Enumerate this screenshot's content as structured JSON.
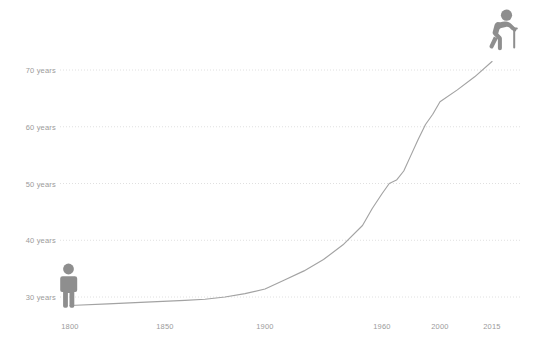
{
  "chart_data": {
    "type": "line",
    "title": "",
    "subtitle": "",
    "xlabel": "",
    "ylabel": "",
    "xlim": [
      1790,
      2020
    ],
    "ylim": [
      26,
      74
    ],
    "grid": true,
    "legend": "none",
    "y_ticks": [
      {
        "value": 30,
        "label": "30 years"
      },
      {
        "value": 40,
        "label": "40 years"
      },
      {
        "value": 50,
        "label": "50 years"
      },
      {
        "value": 60,
        "label": "60 years"
      },
      {
        "value": 70,
        "label": "70 years"
      }
    ],
    "x_ticks": [
      {
        "value": 1800,
        "label": "1800"
      },
      {
        "value": 1850,
        "label": "1850"
      },
      {
        "value": 1900,
        "label": "1900"
      },
      {
        "value": 1960,
        "label": "1960"
      },
      {
        "value": 2000,
        "label": "2000"
      },
      {
        "value": 2015,
        "label": "2015"
      }
    ],
    "series": [
      {
        "name": "Life expectancy",
        "color": "#a3a3a3",
        "x": [
          1800,
          1820,
          1840,
          1860,
          1870,
          1880,
          1890,
          1900,
          1910,
          1920,
          1930,
          1940,
          1950,
          1955,
          1960,
          1965,
          1970,
          1975,
          1980,
          1985,
          1990,
          1995,
          2000,
          2005,
          2010,
          2015
        ],
        "y": [
          28.5,
          28.8,
          29.1,
          29.4,
          29.6,
          30.0,
          30.6,
          31.4,
          33.0,
          34.6,
          36.6,
          39.2,
          42.6,
          45.6,
          48.2,
          50.0,
          50.6,
          52.2,
          55.0,
          57.8,
          60.4,
          62.2,
          64.4,
          66.5,
          68.8,
          71.5
        ]
      }
    ],
    "annotations": [
      {
        "name": "standing-person-icon",
        "x": 1805,
        "y": 33.5,
        "meaning": "young adult figure"
      },
      {
        "name": "elderly-person-with-cane-icon",
        "x": 2013,
        "y": 78.5,
        "meaning": "elderly figure with cane"
      }
    ],
    "colors": {
      "line": "#a3a3a3",
      "grid": "#d8d8d8",
      "text": "#9b9b9b",
      "icon": "#8e8e8e",
      "background": "#ffffff"
    }
  }
}
